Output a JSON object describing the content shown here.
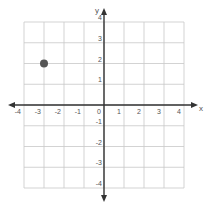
{
  "chart_data": {
    "type": "scatter",
    "title": "",
    "xlabel": "x",
    "ylabel": "y",
    "xlim": [
      -4,
      4
    ],
    "ylim": [
      -4,
      4
    ],
    "grid": true,
    "x_ticks": [
      -4,
      -3,
      -2,
      -1,
      0,
      1,
      2,
      3,
      4
    ],
    "y_ticks": [
      -4,
      -3,
      -2,
      -1,
      1,
      2,
      3,
      4
    ],
    "series": [
      {
        "name": "point",
        "points": [
          {
            "x": -3,
            "y": 2
          }
        ],
        "color": "#555555"
      }
    ]
  },
  "colors": {
    "grid": "#c8c8c8",
    "axis": "#333333",
    "text": "#555555",
    "point": "#555555"
  }
}
